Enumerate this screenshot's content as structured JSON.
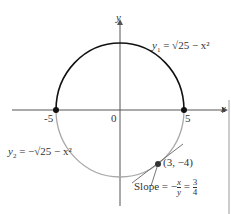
{
  "figure": {
    "axes": {
      "x_label": "x",
      "y_label": "y",
      "ticks": [
        "-5",
        "0",
        "5"
      ]
    },
    "upper_curve": {
      "label_lhs": "y",
      "label_sub": "1",
      "label_rhs": "= √25 − x²",
      "color": "#111111"
    },
    "lower_curve": {
      "label_lhs": "y",
      "label_sub": "2",
      "label_rhs": "= −√25 − x²",
      "color": "#a0a0a0"
    },
    "point": {
      "label": "(3, −4)"
    },
    "slope": {
      "text": "Slope = −",
      "num": "x",
      "den": "y",
      "eq": "=",
      "num2": "3",
      "den2": "4"
    }
  }
}
